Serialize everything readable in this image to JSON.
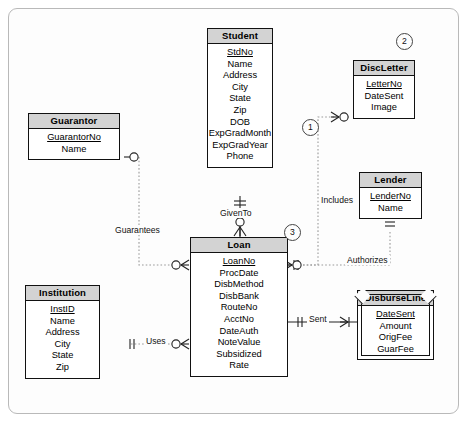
{
  "diagram": {
    "entities": [
      {
        "key": "student",
        "name": "Student",
        "weak": false,
        "attributes": [
          {
            "label": "StdNo",
            "pk": true
          },
          {
            "label": "Name",
            "pk": false
          },
          {
            "label": "Address",
            "pk": false
          },
          {
            "label": "City",
            "pk": false
          },
          {
            "label": "State",
            "pk": false
          },
          {
            "label": "Zip",
            "pk": false
          },
          {
            "label": "DOB",
            "pk": false
          },
          {
            "label": "ExpGradMonth",
            "pk": false
          },
          {
            "label": "ExpGradYear",
            "pk": false
          },
          {
            "label": "Phone",
            "pk": false
          }
        ]
      },
      {
        "key": "discletter",
        "name": "DiscLetter",
        "weak": false,
        "attributes": [
          {
            "label": "LetterNo",
            "pk": true
          },
          {
            "label": "DateSent",
            "pk": false
          },
          {
            "label": "Image",
            "pk": false
          }
        ]
      },
      {
        "key": "guarantor",
        "name": "Guarantor",
        "weak": false,
        "attributes": [
          {
            "label": "GuarantorNo",
            "pk": true
          },
          {
            "label": "Name",
            "pk": false
          }
        ]
      },
      {
        "key": "lender",
        "name": "Lender",
        "weak": false,
        "attributes": [
          {
            "label": "LenderNo",
            "pk": true
          },
          {
            "label": "Name",
            "pk": false
          }
        ]
      },
      {
        "key": "institution",
        "name": "Institution",
        "weak": false,
        "attributes": [
          {
            "label": "InstID",
            "pk": true
          },
          {
            "label": "Name",
            "pk": false
          },
          {
            "label": "Address",
            "pk": false
          },
          {
            "label": "City",
            "pk": false
          },
          {
            "label": "State",
            "pk": false
          },
          {
            "label": "Zip",
            "pk": false
          }
        ]
      },
      {
        "key": "loan",
        "name": "Loan",
        "weak": false,
        "attributes": [
          {
            "label": "LoanNo",
            "pk": true
          },
          {
            "label": "ProcDate",
            "pk": false
          },
          {
            "label": "DisbMethod",
            "pk": false
          },
          {
            "label": "DisbBank",
            "pk": false
          },
          {
            "label": "RouteNo",
            "pk": false
          },
          {
            "label": "AcctNo",
            "pk": false
          },
          {
            "label": "DateAuth",
            "pk": false
          },
          {
            "label": "NoteValue",
            "pk": false
          },
          {
            "label": "Subsidized",
            "pk": false
          },
          {
            "label": "Rate",
            "pk": false
          }
        ]
      },
      {
        "key": "disburseline",
        "name": "DisburseLine",
        "weak": true,
        "attributes": [
          {
            "label": "DateSent",
            "pk": true
          },
          {
            "label": "Amount",
            "pk": false
          },
          {
            "label": "OrigFee",
            "pk": false
          },
          {
            "label": "GuarFee",
            "pk": false
          }
        ]
      }
    ],
    "relationships": [
      {
        "key": "guarantees",
        "label": "Guarantees",
        "style": "dashed",
        "from": "Guarantor",
        "to": "Loan"
      },
      {
        "key": "includes",
        "label": "Includes",
        "style": "dashed",
        "from": "DiscLetter",
        "to": "Loan"
      },
      {
        "key": "giventto",
        "label": "GivenTo",
        "style": "solid",
        "from": "Student",
        "to": "Loan"
      },
      {
        "key": "authorizes",
        "label": "Authorizes",
        "style": "dashed",
        "from": "Lender",
        "to": "Loan"
      },
      {
        "key": "sent",
        "label": "Sent",
        "style": "solid",
        "from": "Loan",
        "to": "DisburseLine"
      },
      {
        "key": "uses",
        "label": "Uses",
        "style": "dashed",
        "from": "Institution",
        "to": "Loan"
      }
    ],
    "annotations": [
      {
        "key": "marker-1",
        "label": "1"
      },
      {
        "key": "marker-2",
        "label": "2"
      },
      {
        "key": "marker-3",
        "label": "3"
      }
    ]
  }
}
